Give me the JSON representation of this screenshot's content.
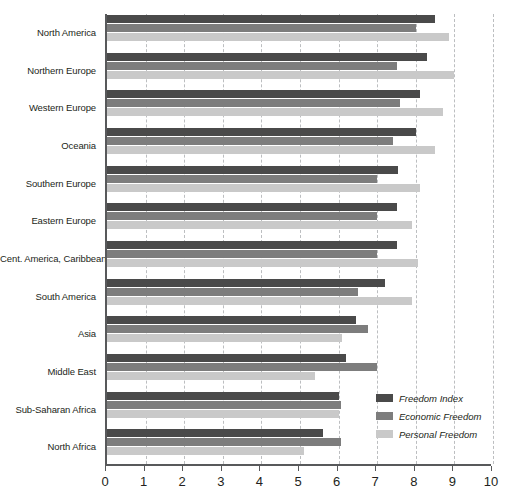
{
  "chart_data": {
    "type": "bar",
    "orientation": "horizontal",
    "title": "",
    "subtitle": "",
    "xlabel": "",
    "ylabel": "",
    "xlim": [
      0,
      10
    ],
    "xticks": [
      0,
      1,
      2,
      3,
      4,
      5,
      6,
      7,
      8,
      9,
      10
    ],
    "xtick_labels": [
      "0",
      "1",
      "2",
      "3",
      "4",
      "5",
      "6",
      "7",
      "8",
      "9",
      "10"
    ],
    "grid": "vertical-dashed",
    "legend_position": "bottom-right",
    "categories": [
      "North America",
      "Northern Europe",
      "Western Europe",
      "Oceania",
      "Southern Europe",
      "Eastern Europe",
      "Cent. America, Caribbean",
      "South America",
      "Asia",
      "Middle East",
      "Sub-Saharan Africa",
      "North Africa"
    ],
    "series": [
      {
        "name": "Freedom Index",
        "color": "#4a4a4a",
        "values": [
          8.5,
          8.3,
          8.1,
          8.0,
          7.55,
          7.5,
          7.5,
          7.2,
          6.45,
          6.2,
          6.0,
          5.6
        ]
      },
      {
        "name": "Economic Freedom",
        "color": "#7d7d7d",
        "values": [
          8.0,
          7.5,
          7.6,
          7.4,
          7.0,
          7.0,
          7.0,
          6.5,
          6.75,
          7.0,
          6.05,
          6.05
        ]
      },
      {
        "name": "Personal Freedom",
        "color": "#c9c9c9",
        "values": [
          8.85,
          9.0,
          8.7,
          8.5,
          8.1,
          7.9,
          8.05,
          7.9,
          6.1,
          5.4,
          6.0,
          5.1
        ]
      }
    ]
  },
  "legend": {
    "items": [
      {
        "label": "Freedom Index",
        "color": "#4a4a4a"
      },
      {
        "label": "Economic Freedom",
        "color": "#7d7d7d"
      },
      {
        "label": "Personal Freedom",
        "color": "#c9c9c9"
      }
    ]
  },
  "colors": {
    "axis": "#58595b",
    "gridline": "#bcbec0",
    "text": "#231f20",
    "background": "#ffffff"
  }
}
